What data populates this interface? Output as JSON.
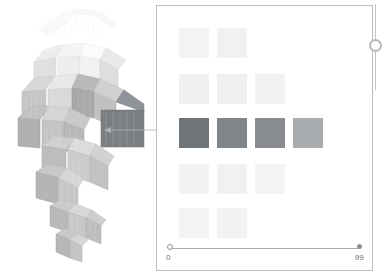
{
  "app": {
    "background_color": "#ffffff",
    "width": 384,
    "height": 278
  },
  "helix_view": {
    "name": "3d-helix-visualization",
    "description": "3D spiral of curved wedge blocks",
    "turns": 3,
    "block_palette": [
      "#f2f2f2",
      "#e6e6e6",
      "#d4d4d4",
      "#bdbdbd",
      "#a6a6a6",
      "#8f8f8f",
      "#7d7d7d"
    ],
    "selected_block_color": "#7b7f84",
    "outline_color": "#c8cacd"
  },
  "connector": {
    "name": "callout-connector",
    "stroke_color": "#aeb1b6",
    "arrow_direction": "left",
    "from_x": 306,
    "from_y": 130,
    "to_x": 104,
    "to_y": 130
  },
  "detail_panel": {
    "border_color": "#b9bcc2",
    "background": "#ffffff"
  },
  "grid": {
    "name": "detail-grid",
    "cell_size": 30,
    "gap": 8,
    "highlight_row_index": 2,
    "rows": [
      {
        "row_index": 0,
        "top": 22,
        "left_offset": 22,
        "cells": [
          {
            "value": 0,
            "color": "#f3f3f3"
          },
          {
            "value": 1,
            "color": "#f1f1f1"
          }
        ]
      },
      {
        "row_index": 1,
        "top": 68,
        "left_offset": 22,
        "cells": [
          {
            "value": 2,
            "color": "#f0f0f0"
          },
          {
            "value": 3,
            "color": "#efefef"
          },
          {
            "value": 4,
            "color": "#f2f2f2"
          }
        ]
      },
      {
        "row_index": 2,
        "top": 112,
        "left_offset": 22,
        "cells": [
          {
            "value": 5,
            "color": "#6f7478"
          },
          {
            "value": 6,
            "color": "#808589"
          },
          {
            "value": 7,
            "color": "#898d91"
          },
          {
            "value": 8,
            "color": "#a9acaf"
          }
        ]
      },
      {
        "row_index": 3,
        "top": 158,
        "left_offset": 22,
        "cells": [
          {
            "value": 9,
            "color": "#f2f2f2"
          },
          {
            "value": 10,
            "color": "#f1f1f1"
          },
          {
            "value": 11,
            "color": "#f4f4f4"
          }
        ]
      },
      {
        "row_index": 4,
        "top": 202,
        "left_offset": 22,
        "cells": [
          {
            "value": 12,
            "color": "#f3f3f3"
          },
          {
            "value": 13,
            "color": "#f2f2f2"
          }
        ]
      }
    ]
  },
  "slider": {
    "name": "range-slider",
    "min_label": "0",
    "max_label": "99",
    "min_value": 0,
    "max_value": 99,
    "track_color": "#a8abb1",
    "label_color": "#6e7177"
  },
  "edge_control": {
    "name": "edge-knob-control",
    "line_color": "#c2c5ca",
    "knob_border_color": "#b5b8be"
  }
}
